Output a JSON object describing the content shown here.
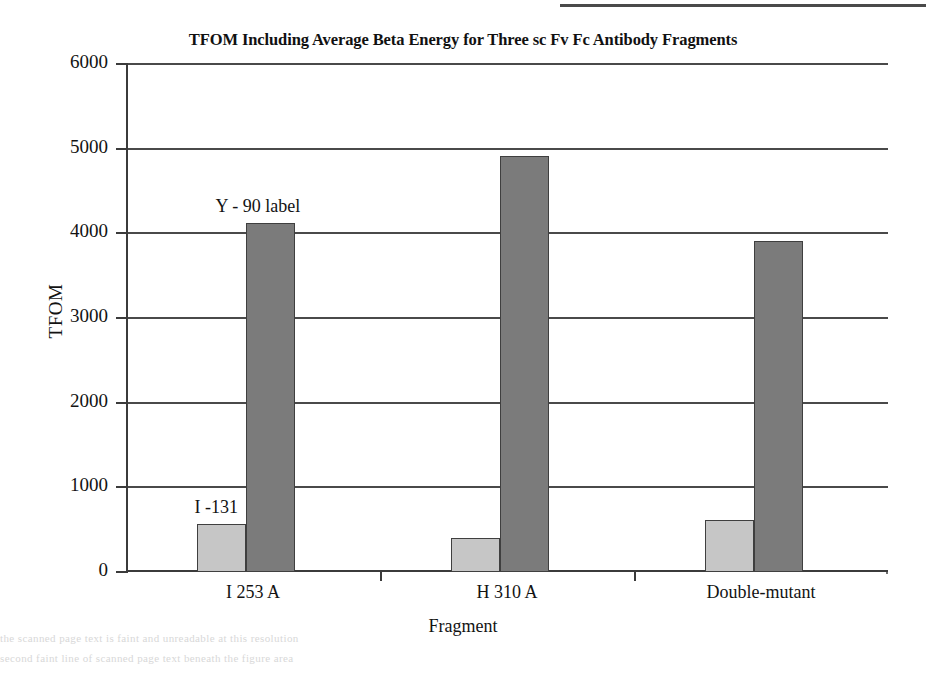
{
  "chart_data": {
    "type": "bar",
    "title": "TFOM Including Average Beta Energy for Three sc Fv Fc Antibody Fragments",
    "xlabel": "Fragment",
    "ylabel": "TFOM",
    "categories": [
      "I 253 A",
      "H 310 A",
      "Double-mutant"
    ],
    "series": [
      {
        "name": "I -131",
        "color": "#c6c6c6",
        "values": [
          570,
          400,
          610
        ]
      },
      {
        "name": "Y - 90 label",
        "color": "#7b7b7b",
        "values": [
          4120,
          4910,
          3910
        ]
      }
    ],
    "ylim": [
      0,
      6000
    ],
    "yticks": [
      6000,
      5000,
      4000,
      3000,
      2000,
      1000,
      0
    ],
    "ytick_labels": [
      "6000",
      "5000",
      "4000",
      "3000",
      "2000",
      "1000",
      "0"
    ],
    "grid": true,
    "legend_position": "none",
    "annotations": [
      {
        "text": "Y - 90 label",
        "target": "I 253 A / Y-90 bar"
      },
      {
        "text": "I -131",
        "target": "I 253 A / I-131 bar"
      }
    ]
  },
  "page": {
    "scan_line_1": "the scanned page text is faint and unreadable at this resolution",
    "scan_line_2": "second faint line of scanned page text beneath the figure area"
  }
}
